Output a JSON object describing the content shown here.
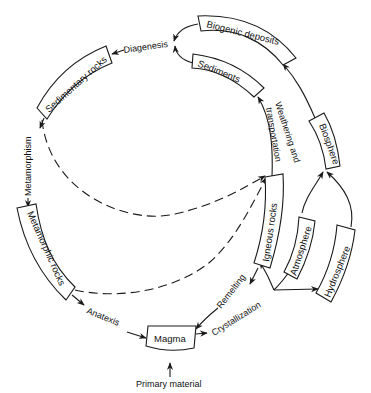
{
  "diagram": {
    "type": "cycle",
    "nodes": {
      "biogenic_deposits": "Biogenic deposits",
      "sediments": "Sediments",
      "sedimentary_rocks": "Sedimentary rocks",
      "metamorphic_rocks": "Metamorphic rocks",
      "magma": "Magma",
      "igneous_rocks": "Igneous rocks",
      "biosphere": "Biosphere",
      "atmosphere": "Atmosphere",
      "hydrosphere": "Hydrosphere"
    },
    "processes": {
      "diagenesis": "Diagenesis",
      "metamorphism": "Metamorphism",
      "anatexis": "Anatexis",
      "crystallization": "Crystallization",
      "remelting": "Remelting",
      "weathering_line1": "Weathering and",
      "weathering_line2": "transportation",
      "primary_material": "Primary material"
    },
    "edges": [
      {
        "from": "Biogenic deposits",
        "to": "Diagenesis",
        "style": "solid"
      },
      {
        "from": "Sediments",
        "to": "Diagenesis",
        "style": "solid"
      },
      {
        "from": "Diagenesis",
        "to": "Sedimentary rocks",
        "style": "solid"
      },
      {
        "from": "Sedimentary rocks",
        "to": "Metamorphic rocks",
        "via": "Metamorphism",
        "style": "solid"
      },
      {
        "from": "Metamorphic rocks",
        "to": "Magma",
        "via": "Anatexis",
        "style": "solid"
      },
      {
        "from": "Primary material",
        "to": "Magma",
        "style": "solid"
      },
      {
        "from": "Magma",
        "to": "Crystallization",
        "style": "solid"
      },
      {
        "from": "Crystallization",
        "to": "Igneous rocks",
        "style": "solid"
      },
      {
        "from": "Crystallization",
        "to": "Atmosphere",
        "style": "solid"
      },
      {
        "from": "Crystallization",
        "to": "Hydrosphere",
        "style": "solid"
      },
      {
        "from": "Igneous rocks",
        "to": "Magma",
        "via": "Remelting",
        "style": "solid"
      },
      {
        "from": "Igneous rocks",
        "to": "Sediments",
        "via": "Weathering and transportation",
        "style": "solid"
      },
      {
        "from": "Atmosphere",
        "to": "Biosphere",
        "style": "solid"
      },
      {
        "from": "Hydrosphere",
        "to": "Biosphere",
        "style": "solid"
      },
      {
        "from": "Biosphere",
        "to": "Biogenic deposits",
        "style": "solid"
      },
      {
        "from": "Sedimentary rocks",
        "to": "Weathering and transportation",
        "style": "dashed"
      },
      {
        "from": "Metamorphic rocks",
        "to": "Weathering and transportation",
        "style": "dashed"
      }
    ]
  }
}
